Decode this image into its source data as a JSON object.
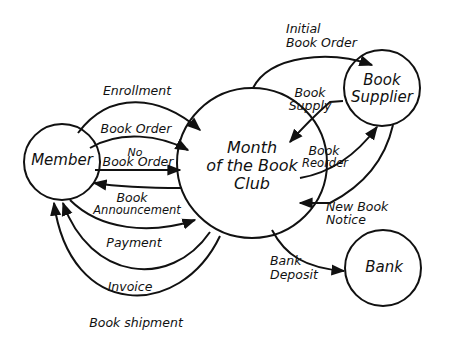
{
  "diagram": {
    "type": "data-flow-diagram",
    "nodes": [
      {
        "id": "member",
        "label": "Member"
      },
      {
        "id": "club",
        "label_lines": [
          "Month",
          "of the Book",
          "Club"
        ]
      },
      {
        "id": "supplier",
        "label_lines": [
          "Book",
          "Supplier"
        ]
      },
      {
        "id": "bank",
        "label": "Bank"
      }
    ],
    "flows": [
      {
        "id": "enrollment",
        "label": "Enrollment",
        "from": "member",
        "to": "club"
      },
      {
        "id": "book_order",
        "label": "Book Order",
        "from": "member",
        "to": "club"
      },
      {
        "id": "no_book_order",
        "label_lines": [
          "No",
          "Book Order"
        ],
        "from": "member",
        "to": "club"
      },
      {
        "id": "book_announcement",
        "label_lines": [
          "Book",
          "Announcement"
        ],
        "from": "club",
        "to": "member"
      },
      {
        "id": "payment",
        "label": "Payment",
        "from": "member",
        "to": "club"
      },
      {
        "id": "invoice",
        "label": "Invoice",
        "from": "club",
        "to": "member"
      },
      {
        "id": "book_shipment",
        "label": "Book shipment",
        "from": "club",
        "to": "member"
      },
      {
        "id": "initial_book_order",
        "label_lines": [
          "Initial",
          "Book Order"
        ],
        "from": "club",
        "to": "supplier"
      },
      {
        "id": "book_supply",
        "label_lines": [
          "Book",
          "Supply"
        ],
        "from": "supplier",
        "to": "club"
      },
      {
        "id": "book_reorder",
        "label_lines": [
          "Book",
          "Reorder"
        ],
        "from": "club",
        "to": "supplier"
      },
      {
        "id": "new_book_notice",
        "label_lines": [
          "New Book",
          "Notice"
        ],
        "from": "supplier",
        "to": "club"
      },
      {
        "id": "bank_deposit",
        "label_lines": [
          "Bank",
          "Deposit"
        ],
        "from": "club",
        "to": "bank"
      }
    ],
    "colors": {
      "stroke": "#111111",
      "background": "#ffffff"
    }
  }
}
